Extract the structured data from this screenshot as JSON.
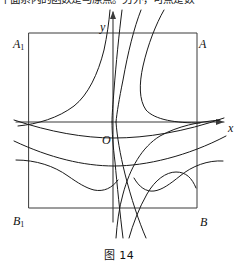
{
  "page": {
    "background_color": "#ffffff",
    "ink_color": "#1a1a1a"
  },
  "top_text": {
    "text": "平面系内的函数是与原点。另外，可点是数",
    "note": "partially clipped line of body text above the figure"
  },
  "figure": {
    "caption_prefix": "图",
    "caption_number": "14",
    "caption": "图 14",
    "rectangle": {
      "name": "A1ABB1",
      "corner_labels": {
        "top_left": "A",
        "top_left_sub": "1",
        "top_right": "A",
        "bottom_left": "B",
        "bottom_left_sub": "1",
        "bottom_right": "B"
      },
      "left": 29,
      "right": 197,
      "top": 33,
      "bottom": 208
    },
    "axes": {
      "origin_label": "O",
      "x_axis_label": "x",
      "y_axis_label": "y",
      "origin": {
        "x": 113,
        "y": 122
      },
      "x_axis_y": 122,
      "y_axis_x": 113,
      "x_arrow_tip": {
        "x": 226,
        "y": 122
      },
      "y_arrow_tip": {
        "x": 113,
        "y": 11
      }
    }
  },
  "chart_data": {
    "type": "line",
    "title": "图 14",
    "xlabel": "x",
    "ylabel": "y",
    "grid": false,
    "legend": null,
    "xlim": [
      -2.0,
      2.0
    ],
    "ylim": [
      -2.0,
      2.0
    ],
    "annotations": [
      "A_1",
      "A",
      "B_1",
      "B",
      "O",
      "x",
      "y"
    ],
    "series": [
      {
        "name": "curve-1-upper-left",
        "kind": "hyperbola-branch",
        "quadrant": "II",
        "points_note": "rises steeply from near (-2,-0.05) toward top near x=0"
      },
      {
        "name": "curve-1-lower-right",
        "kind": "hyperbola-branch",
        "quadrant": "IV",
        "points_note": "mirror branch descending to bottom near x=0"
      },
      {
        "name": "curve-2-upper-right",
        "kind": "hyperbola-branch",
        "quadrant": "I",
        "points_note": "steep branch just right of y-axis"
      },
      {
        "name": "curve-2-lower-left",
        "kind": "hyperbola-branch",
        "quadrant": "III",
        "points_note": "steep branch just left of axis going to bottom"
      },
      {
        "name": "curve-3-upper-right",
        "kind": "hyperbola-branch",
        "quadrant": "I",
        "points_note": "steeper branch further right of y-axis"
      },
      {
        "name": "curve-3-lower",
        "kind": "hyperbola-branch",
        "quadrant": "IV",
        "points_note": "descending branch to bottom edge"
      },
      {
        "name": "curve-4-upper-right",
        "kind": "hyperbola-branch",
        "quadrant": "I",
        "points_note": "branch bending right toward x-axis near x=2"
      },
      {
        "name": "curve-4-lower-right",
        "kind": "hyperbola-branch",
        "quadrant": "IV",
        "points_note": "branch bending down from x-axis near x=0.8"
      },
      {
        "name": "curve-5-flat-upper",
        "kind": "flat-arc",
        "quadrant": "III-IV",
        "points_note": "shallow arc just below x-axis spanning full width"
      },
      {
        "name": "curve-6-flat-lower",
        "kind": "flat-arc",
        "quadrant": "III-IV",
        "points_note": "deeper shallow arc below, spanning full width"
      },
      {
        "name": "curve-7-hump-left",
        "kind": "hump",
        "quadrant": "III",
        "points_note": "rounded hump peaking around x=-1 below axis"
      },
      {
        "name": "curve-8-hump-right",
        "kind": "hump",
        "quadrant": "IV",
        "points_note": "rounded hump peaking around x=1 below axis"
      }
    ]
  }
}
